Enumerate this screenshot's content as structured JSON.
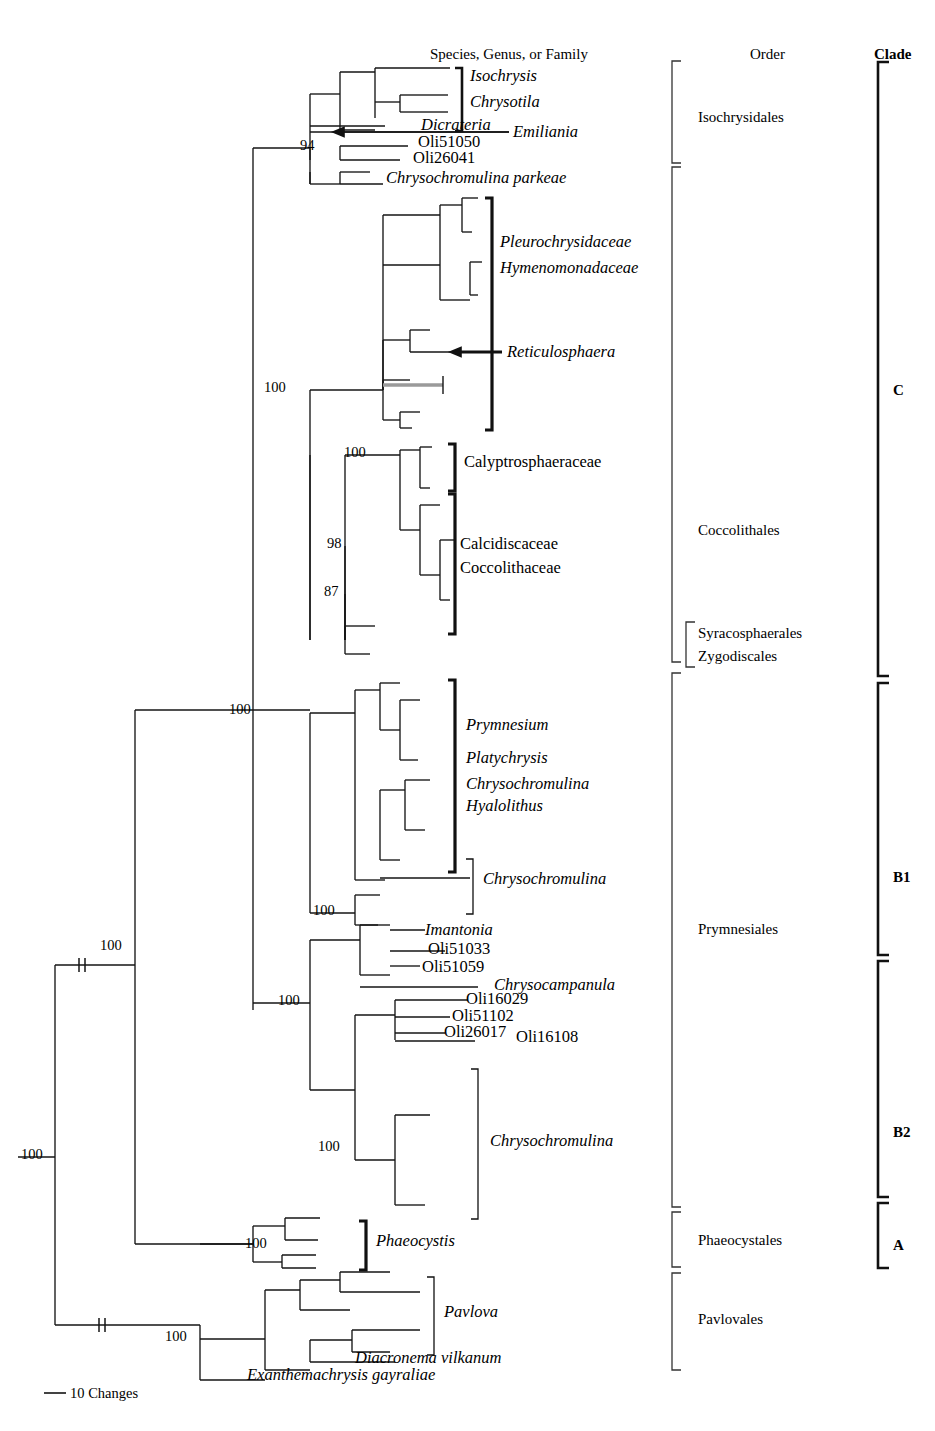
{
  "figure": {
    "type": "phylogenetic-tree",
    "orientation": "left-to-right-rectangular-cladogram",
    "scale_bar": {
      "label": "10 Changes",
      "length_px": 22
    }
  },
  "headers": {
    "taxa": "Species, Genus, or Family",
    "order": "Order",
    "clade": "Clade"
  },
  "taxa_labels": [
    {
      "id": "isochrysis",
      "text": "Isochrysis",
      "italic": true,
      "x": 470,
      "y": 78
    },
    {
      "id": "chrysotila",
      "text": "Chrysotila",
      "italic": true,
      "x": 470,
      "y": 104
    },
    {
      "id": "dicrateria",
      "text": "Dicrateria",
      "italic": true,
      "x": 421,
      "y": 127
    },
    {
      "id": "emiliania",
      "text": "Emiliania",
      "italic": true,
      "x": 513,
      "y": 134
    },
    {
      "id": "oli51050",
      "text": "Oli51050",
      "italic": false,
      "x": 418,
      "y": 144
    },
    {
      "id": "oli26041",
      "text": "Oli26041",
      "italic": false,
      "x": 413,
      "y": 160
    },
    {
      "id": "chrysochromulina-parkeae",
      "text": "Chrysochromulina parkeae",
      "italic": true,
      "x": 386,
      "y": 180
    },
    {
      "id": "pleurochrysidaceae",
      "text": "Pleurochrysidaceae",
      "italic": true,
      "x": 500,
      "y": 244
    },
    {
      "id": "hymenomonadaceae",
      "text": "Hymenomonadaceae",
      "italic": true,
      "x": 500,
      "y": 270
    },
    {
      "id": "reticulosphaera",
      "text": "Reticulosphaera",
      "italic": true,
      "x": 507,
      "y": 354
    },
    {
      "id": "calyptrosphaeraceae",
      "text": "Calyptrosphaeraceae",
      "italic": false,
      "x": 464,
      "y": 464
    },
    {
      "id": "calcidiscaceae",
      "text": "Calcidiscaceae",
      "italic": false,
      "x": 460,
      "y": 546
    },
    {
      "id": "coccolithaceae",
      "text": "Coccolithaceae",
      "italic": false,
      "x": 460,
      "y": 570
    },
    {
      "id": "prymnesium",
      "text": "Prymnesium",
      "italic": true,
      "x": 466,
      "y": 727
    },
    {
      "id": "platychrysis",
      "text": "Platychrysis",
      "italic": true,
      "x": 466,
      "y": 760
    },
    {
      "id": "chrysochromulina-b1",
      "text": "Chrysochromulina",
      "italic": true,
      "x": 466,
      "y": 786
    },
    {
      "id": "hyalolithus",
      "text": "Hyalolithus",
      "italic": true,
      "x": 466,
      "y": 808
    },
    {
      "id": "chrysochromulina-mid",
      "text": "Chrysochromulina",
      "italic": true,
      "x": 483,
      "y": 881
    },
    {
      "id": "imantonia",
      "text": "Imantonia",
      "italic": true,
      "x": 425,
      "y": 932
    },
    {
      "id": "oli51033",
      "text": "Oli51033",
      "italic": false,
      "x": 428,
      "y": 951
    },
    {
      "id": "oli51059",
      "text": "Oli51059",
      "italic": false,
      "x": 422,
      "y": 969
    },
    {
      "id": "chrysocampanula",
      "text": "Chrysocampanula",
      "italic": true,
      "x": 494,
      "y": 987
    },
    {
      "id": "oli16029",
      "text": "Oli16029",
      "italic": false,
      "x": 466,
      "y": 1001
    },
    {
      "id": "oli51102",
      "text": "Oli51102",
      "italic": false,
      "x": 452,
      "y": 1018
    },
    {
      "id": "oli26017",
      "text": "Oli26017",
      "italic": false,
      "x": 444,
      "y": 1034
    },
    {
      "id": "oli16108",
      "text": "Oli16108",
      "italic": false,
      "x": 516,
      "y": 1039
    },
    {
      "id": "chrysochromulina-b2",
      "text": "Chrysochromulina",
      "italic": true,
      "x": 490,
      "y": 1143
    },
    {
      "id": "phaeocystis",
      "text": "Phaeocystis",
      "italic": true,
      "x": 376,
      "y": 1243
    },
    {
      "id": "pavlova",
      "text": "Pavlova",
      "italic": true,
      "x": 444,
      "y": 1314
    },
    {
      "id": "diacronema-vilkanum",
      "text": "Diacronema vilkanum",
      "italic": true,
      "x": 355,
      "y": 1360
    },
    {
      "id": "exanthemachrysis",
      "text": "Exanthemachrysis gayraliae",
      "italic": true,
      "x": 247,
      "y": 1377
    }
  ],
  "orders": [
    {
      "id": "isochrysidales",
      "label": "Isochrysidales",
      "x": 698,
      "y": 120,
      "bracket": {
        "x": 672,
        "top": 61,
        "bottom": 163
      }
    },
    {
      "id": "coccolithales",
      "label": "Coccolithales",
      "x": 698,
      "y": 533,
      "bracket": {
        "x": 672,
        "top": 167,
        "bottom": 662
      }
    },
    {
      "id": "syracosphaerales",
      "label": "Syracosphaerales",
      "x": 698,
      "y": 636,
      "bracket": {
        "x": 686,
        "top": 622,
        "bottom": 667
      }
    },
    {
      "id": "zygodiscales",
      "label": "Zygodiscales",
      "x": 698,
      "y": 659,
      "bracket": null
    },
    {
      "id": "prymnesiales",
      "label": "Prymnesiales",
      "x": 698,
      "y": 932,
      "bracket": {
        "x": 672,
        "top": 673,
        "bottom": 1207
      }
    },
    {
      "id": "phaeocystales",
      "label": "Phaeocystales",
      "x": 698,
      "y": 1243,
      "bracket": {
        "x": 672,
        "top": 1212,
        "bottom": 1267
      }
    },
    {
      "id": "pavlovales",
      "label": "Pavlovales",
      "x": 698,
      "y": 1322,
      "bracket": {
        "x": 672,
        "top": 1273,
        "bottom": 1370
      }
    }
  ],
  "clades": [
    {
      "id": "clade-c",
      "label": "C",
      "x": 893,
      "y": 393,
      "bracket": {
        "x": 878,
        "top": 62,
        "bottom": 676
      }
    },
    {
      "id": "clade-b1",
      "label": "B1",
      "x": 893,
      "y": 880,
      "bracket": {
        "x": 878,
        "top": 683,
        "bottom": 955
      }
    },
    {
      "id": "clade-b2",
      "label": "B2",
      "x": 893,
      "y": 1135,
      "bracket": {
        "x": 878,
        "top": 961,
        "bottom": 1197
      }
    },
    {
      "id": "clade-a",
      "label": "A",
      "x": 893,
      "y": 1248,
      "bracket": {
        "x": 878,
        "top": 1203,
        "bottom": 1268
      }
    }
  ],
  "bootstrap_values": [
    {
      "id": "bs-94-isochrysidales",
      "value": "94",
      "x": 300,
      "y": 148
    },
    {
      "id": "bs-100-cladec",
      "value": "100",
      "x": 264,
      "y": 390
    },
    {
      "id": "bs-100-coccolith",
      "value": "100",
      "x": 344,
      "y": 455
    },
    {
      "id": "bs-98",
      "value": "98",
      "x": 327,
      "y": 546
    },
    {
      "id": "bs-87",
      "value": "87",
      "x": 324,
      "y": 594
    },
    {
      "id": "bs-100-prymbase",
      "value": "100",
      "x": 229,
      "y": 712
    },
    {
      "id": "bs-100-chryso-mid",
      "value": "100",
      "x": 313,
      "y": 913
    },
    {
      "id": "bs-100-prym-node",
      "value": "100",
      "x": 278,
      "y": 1003
    },
    {
      "id": "bs-100-b2",
      "value": "100",
      "x": 318,
      "y": 1149
    },
    {
      "id": "bs-100-upper-root",
      "value": "100",
      "x": 100,
      "y": 948
    },
    {
      "id": "bs-100-root",
      "value": "100",
      "x": 21,
      "y": 1157
    },
    {
      "id": "bs-100-phaeocystis",
      "value": "100",
      "x": 245,
      "y": 1246
    },
    {
      "id": "bs-100-pavlovales",
      "value": "100",
      "x": 165,
      "y": 1339
    }
  ],
  "arrows": [
    {
      "id": "arrow-emiliania",
      "tip_x": 333,
      "y": 132,
      "tail_x": 509
    },
    {
      "id": "arrow-reticulosphaera",
      "tip_x": 450,
      "y": 352,
      "tail_x": 502
    }
  ],
  "taxa_brackets": [
    {
      "id": "br-isochrysis-chrysotila",
      "x": 462,
      "top": 68,
      "bottom": 131,
      "weight": 2.6
    },
    {
      "id": "br-pleurochrysidaceae",
      "x": 492,
      "top": 198,
      "bottom": 430,
      "weight": 3.2
    },
    {
      "id": "br-calyptrosphaeraceae",
      "x": 455,
      "top": 444,
      "bottom": 491,
      "weight": 3.2
    },
    {
      "id": "br-calcidisc-coccolith",
      "x": 455,
      "top": 494,
      "bottom": 634,
      "weight": 3.2
    },
    {
      "id": "br-prymnesium-group",
      "x": 455,
      "top": 680,
      "bottom": 872,
      "weight": 3.2
    },
    {
      "id": "br-chrysochromulina-mid",
      "x": 473,
      "top": 859,
      "bottom": 914,
      "weight": 1.3
    },
    {
      "id": "br-chrysochromulina-b2",
      "x": 478,
      "top": 1069,
      "bottom": 1219,
      "weight": 1.3
    },
    {
      "id": "br-phaeocystis",
      "x": 366,
      "top": 1221,
      "bottom": 1270,
      "weight": 3.2
    },
    {
      "id": "br-pavlova",
      "x": 434,
      "top": 1277,
      "bottom": 1355,
      "weight": 1.3
    }
  ],
  "tree_edges": {
    "root_x": 18,
    "description": "Rectangular cladogram branch segments",
    "segments": [
      [
        18,
        1157,
        55,
        1157
      ],
      [
        55,
        965,
        55,
        1325
      ],
      [
        55,
        965,
        135,
        965
      ],
      [
        55,
        1325,
        200,
        1325
      ],
      [
        135,
        710,
        135,
        1244
      ],
      [
        135,
        710,
        253,
        710
      ],
      [
        135,
        1244,
        253,
        1244
      ],
      [
        253,
        148,
        253,
        710
      ],
      [
        253,
        148,
        310,
        148
      ],
      [
        253,
        710,
        310,
        710
      ],
      [
        310,
        94,
        310,
        184
      ],
      [
        310,
        94,
        340,
        94
      ],
      [
        310,
        184,
        340,
        184
      ],
      [
        340,
        72,
        340,
        130
      ],
      [
        340,
        72,
        375,
        72
      ],
      [
        340,
        130,
        375,
        130
      ],
      [
        375,
        68,
        375,
        102
      ],
      [
        375,
        68,
        408,
        68
      ],
      [
        375,
        102,
        400,
        102
      ],
      [
        400,
        95,
        400,
        112
      ],
      [
        400,
        95,
        420,
        95
      ],
      [
        400,
        112,
        420,
        112
      ],
      [
        408,
        68,
        450,
        68
      ],
      [
        420,
        95,
        448,
        95
      ],
      [
        420,
        112,
        448,
        112
      ],
      [
        375,
        102,
        375,
        118
      ],
      [
        340,
        130,
        340,
        130
      ],
      [
        310,
        126,
        385,
        126
      ],
      [
        310,
        132,
        509,
        132
      ],
      [
        310,
        148,
        310,
        160
      ],
      [
        340,
        146,
        340,
        160
      ],
      [
        340,
        146,
        408,
        146
      ],
      [
        340,
        160,
        400,
        160
      ],
      [
        310,
        172,
        310,
        184
      ],
      [
        340,
        172,
        340,
        184
      ],
      [
        340,
        172,
        370,
        172
      ],
      [
        340,
        184,
        383,
        184
      ],
      [
        310,
        390,
        310,
        640
      ],
      [
        310,
        390,
        383,
        390
      ],
      [
        383,
        215,
        383,
        390
      ],
      [
        383,
        215,
        440,
        215
      ],
      [
        383,
        340,
        383,
        390
      ],
      [
        383,
        265,
        440,
        265
      ],
      [
        440,
        205,
        440,
        300
      ],
      [
        440,
        205,
        462,
        205
      ],
      [
        440,
        300,
        470,
        300
      ],
      [
        462,
        198,
        462,
        232
      ],
      [
        462,
        198,
        478,
        198
      ],
      [
        462,
        232,
        472,
        232
      ],
      [
        470,
        262,
        470,
        295
      ],
      [
        470,
        262,
        482,
        262
      ],
      [
        470,
        295,
        478,
        295
      ],
      [
        383,
        340,
        410,
        340
      ],
      [
        410,
        330,
        410,
        352
      ],
      [
        410,
        330,
        430,
        330
      ],
      [
        410,
        352,
        450,
        352
      ],
      [
        383,
        380,
        383,
        420
      ],
      [
        383,
        380,
        410,
        380
      ],
      [
        383,
        420,
        400,
        420
      ],
      [
        400,
        412,
        400,
        428
      ],
      [
        400,
        412,
        420,
        412
      ],
      [
        400,
        428,
        412,
        428
      ],
      [
        310,
        455,
        310,
        640
      ],
      [
        345,
        455,
        345,
        640
      ],
      [
        345,
        455,
        400,
        455
      ],
      [
        400,
        450,
        400,
        530
      ],
      [
        400,
        450,
        420,
        450
      ],
      [
        400,
        530,
        420,
        530
      ],
      [
        420,
        447,
        420,
        488
      ],
      [
        420,
        447,
        432,
        447
      ],
      [
        420,
        488,
        430,
        488
      ],
      [
        420,
        505,
        420,
        575
      ],
      [
        420,
        505,
        440,
        505
      ],
      [
        420,
        575,
        440,
        575
      ],
      [
        440,
        540,
        440,
        600
      ],
      [
        440,
        540,
        455,
        540
      ],
      [
        440,
        600,
        450,
        600
      ],
      [
        345,
        546,
        345,
        640
      ],
      [
        345,
        594,
        345,
        640
      ],
      [
        345,
        626,
        345,
        654
      ],
      [
        345,
        626,
        375,
        626
      ],
      [
        345,
        654,
        370,
        654
      ],
      [
        253,
        710,
        253,
        1010
      ],
      [
        310,
        713,
        310,
        913
      ],
      [
        310,
        713,
        355,
        713
      ],
      [
        355,
        690,
        355,
        880
      ],
      [
        355,
        690,
        380,
        690
      ],
      [
        355,
        880,
        385,
        880
      ],
      [
        380,
        683,
        380,
        730
      ],
      [
        380,
        683,
        400,
        683
      ],
      [
        380,
        730,
        400,
        730
      ],
      [
        400,
        700,
        400,
        760
      ],
      [
        400,
        700,
        420,
        700
      ],
      [
        400,
        760,
        418,
        760
      ],
      [
        380,
        790,
        380,
        860
      ],
      [
        380,
        790,
        405,
        790
      ],
      [
        380,
        860,
        400,
        860
      ],
      [
        405,
        780,
        405,
        830
      ],
      [
        405,
        780,
        430,
        780
      ],
      [
        405,
        830,
        425,
        830
      ],
      [
        310,
        913,
        355,
        913
      ],
      [
        355,
        895,
        355,
        925
      ],
      [
        355,
        895,
        380,
        895
      ],
      [
        355,
        925,
        378,
        925
      ],
      [
        380,
        878,
        470,
        878
      ],
      [
        253,
        1003,
        310,
        1003
      ],
      [
        310,
        940,
        310,
        1090
      ],
      [
        310,
        940,
        360,
        940
      ],
      [
        360,
        925,
        360,
        975
      ],
      [
        360,
        925,
        390,
        925
      ],
      [
        360,
        975,
        390,
        975
      ],
      [
        390,
        930,
        425,
        930
      ],
      [
        390,
        951,
        445,
        951
      ],
      [
        390,
        966,
        420,
        966
      ],
      [
        360,
        987,
        478,
        987
      ],
      [
        310,
        1090,
        355,
        1090
      ],
      [
        355,
        1015,
        355,
        1160
      ],
      [
        355,
        1015,
        395,
        1015
      ],
      [
        395,
        1000,
        395,
        1040
      ],
      [
        395,
        1000,
        468,
        1000
      ],
      [
        395,
        1017,
        450,
        1017
      ],
      [
        395,
        1033,
        445,
        1033
      ],
      [
        395,
        1041,
        475,
        1041
      ],
      [
        355,
        1160,
        395,
        1160
      ],
      [
        395,
        1115,
        395,
        1205
      ],
      [
        395,
        1115,
        430,
        1115
      ],
      [
        395,
        1205,
        425,
        1205
      ],
      [
        200,
        1244,
        253,
        1244
      ],
      [
        253,
        1226,
        253,
        1262
      ],
      [
        253,
        1226,
        285,
        1226
      ],
      [
        253,
        1262,
        282,
        1262
      ],
      [
        285,
        1218,
        285,
        1240
      ],
      [
        285,
        1218,
        320,
        1218
      ],
      [
        285,
        1240,
        318,
        1240
      ],
      [
        282,
        1255,
        282,
        1268
      ],
      [
        282,
        1255,
        316,
        1255
      ],
      [
        282,
        1268,
        316,
        1268
      ],
      [
        200,
        1325,
        200,
        1380
      ],
      [
        200,
        1339,
        265,
        1339
      ],
      [
        200,
        1380,
        265,
        1380
      ],
      [
        265,
        1290,
        265,
        1370
      ],
      [
        265,
        1290,
        300,
        1290
      ],
      [
        265,
        1370,
        310,
        1370
      ],
      [
        300,
        1280,
        300,
        1310
      ],
      [
        300,
        1280,
        340,
        1280
      ],
      [
        300,
        1310,
        350,
        1310
      ],
      [
        340,
        1272,
        340,
        1292
      ],
      [
        340,
        1272,
        390,
        1272
      ],
      [
        340,
        1292,
        420,
        1292
      ],
      [
        310,
        1340,
        310,
        1362
      ],
      [
        310,
        1340,
        352,
        1340
      ],
      [
        310,
        1362,
        395,
        1362
      ],
      [
        352,
        1330,
        352,
        1352
      ],
      [
        352,
        1330,
        420,
        1330
      ],
      [
        352,
        1352,
        390,
        1352
      ]
    ],
    "branch_breaks": [
      {
        "x": 82,
        "y": 965
      },
      {
        "x": 102,
        "y": 1325
      }
    ]
  },
  "colors": {
    "line": "#151515",
    "text": "#000000",
    "background": "#ffffff",
    "highlight_gray": "#9a9a9a"
  }
}
